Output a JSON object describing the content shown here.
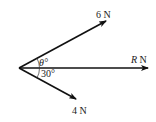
{
  "diagram": {
    "forces": [
      {
        "id": "f6",
        "magnitude_label": "6",
        "unit": "N",
        "label": "6 N"
      },
      {
        "id": "fR",
        "magnitude_label": "R",
        "unit": "N",
        "label": "R N"
      },
      {
        "id": "f4",
        "magnitude_label": "4",
        "unit": "N",
        "label": "4 N"
      }
    ],
    "angles": [
      {
        "id": "theta",
        "label": "θ°",
        "between": [
          "6 N",
          "R N"
        ]
      },
      {
        "id": "thirty",
        "label": "30°",
        "between": [
          "R N",
          "4 N"
        ]
      }
    ],
    "colors": {
      "stroke": "#111111",
      "text": "#222222"
    }
  }
}
